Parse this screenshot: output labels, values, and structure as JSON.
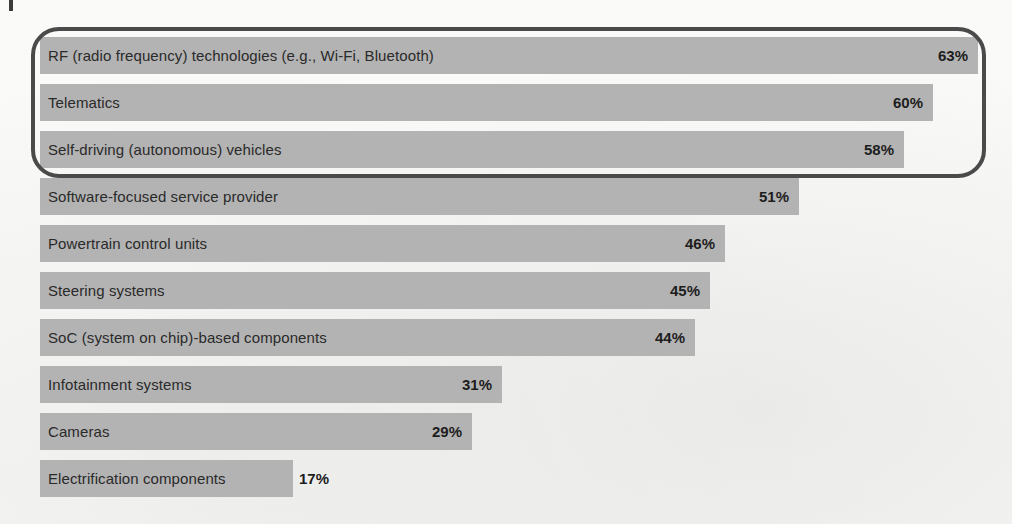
{
  "chart_data": {
    "type": "bar",
    "orientation": "horizontal",
    "title": "",
    "subtitle": "",
    "xlabel": "",
    "ylabel": "",
    "xlim": [
      0,
      63
    ],
    "grid": false,
    "legend": null,
    "value_suffix": "%",
    "categories": [
      "RF (radio frequency) technologies (e.g., Wi-Fi, Bluetooth)",
      "Telematics",
      "Self-driving (autonomous) vehicles",
      "Software-focused service provider",
      "Powertrain control units",
      "Steering systems",
      "SoC (system on chip)-based components",
      "Infotainment systems",
      "Cameras",
      "Electrification components"
    ],
    "values": [
      63,
      60,
      58,
      51,
      46,
      45,
      44,
      31,
      29,
      17
    ],
    "value_labels": [
      "63%",
      "60%",
      "58%",
      "51%",
      "46%",
      "45%",
      "44%",
      "31%",
      "29%",
      "17%"
    ],
    "bars": [
      {
        "label": "RF (radio frequency) technologies (e.g., Wi-Fi, Bluetooth)",
        "value": 63,
        "value_label": "63%",
        "highlighted": true,
        "label_placement": "inside",
        "value_placement": "inside"
      },
      {
        "label": "Telematics",
        "value": 60,
        "value_label": "60%",
        "highlighted": true,
        "label_placement": "inside",
        "value_placement": "inside"
      },
      {
        "label": "Self-driving (autonomous) vehicles",
        "value": 58,
        "value_label": "58%",
        "highlighted": true,
        "label_placement": "inside",
        "value_placement": "inside"
      },
      {
        "label": "Software-focused service provider",
        "value": 51,
        "value_label": "51%",
        "highlighted": false,
        "label_placement": "inside",
        "value_placement": "inside"
      },
      {
        "label": "Powertrain control units",
        "value": 46,
        "value_label": "46%",
        "highlighted": false,
        "label_placement": "inside",
        "value_placement": "inside"
      },
      {
        "label": "Steering systems",
        "value": 45,
        "value_label": "45%",
        "highlighted": false,
        "label_placement": "inside",
        "value_placement": "inside"
      },
      {
        "label": "SoC (system on chip)-based components",
        "value": 44,
        "value_label": "44%",
        "highlighted": false,
        "label_placement": "inside",
        "value_placement": "inside"
      },
      {
        "label": "Infotainment systems",
        "value": 31,
        "value_label": "31%",
        "highlighted": false,
        "label_placement": "inside",
        "value_placement": "inside"
      },
      {
        "label": "Cameras",
        "value": 29,
        "value_label": "29%",
        "highlighted": false,
        "label_placement": "inside",
        "value_placement": "inside"
      },
      {
        "label": "Electrification components",
        "value": 17,
        "value_label": "17%",
        "highlighted": false,
        "label_placement": "inside",
        "value_placement": "after"
      }
    ],
    "annotations": [
      {
        "type": "rounded-rectangle-highlight",
        "covers": [
          "RF (radio frequency) technologies (e.g., Wi-Fi, Bluetooth)",
          "Telematics",
          "Self-driving (autonomous) vehicles"
        ]
      }
    ]
  },
  "colors": {
    "bar": "#b3b3b3",
    "bar_text": "#2a2a2a",
    "value_text": "#1d1d1d",
    "highlight_border": "#4a4a4a",
    "background": "#fbfbfa",
    "corner_tick": "#3b3b3b"
  }
}
